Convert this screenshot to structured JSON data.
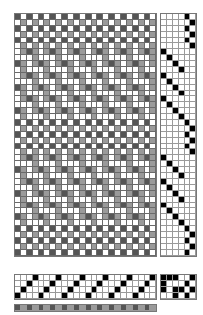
{
  "draft": {
    "warp_count": 24,
    "weft_count": 41,
    "shafts": 4,
    "treadles": 6,
    "cell_px": 5.9,
    "colors": {
      "warp_dark": "#555555",
      "warp_light": "#9a9a9a",
      "weft": "#ffffff",
      "grid_line": "#9a9a9a",
      "mark": "#000000"
    },
    "threading": [
      3,
      2,
      1,
      0,
      3,
      2,
      1,
      0,
      3,
      2,
      1,
      0,
      3,
      2,
      1,
      0,
      3,
      2,
      1,
      0,
      3,
      2,
      1,
      0
    ],
    "tieup": [
      [
        1,
        1,
        1,
        0,
        0,
        1
      ],
      [
        1,
        0,
        0,
        0,
        1,
        0
      ],
      [
        1,
        0,
        1,
        1,
        0,
        1
      ],
      [
        0,
        0,
        1,
        0,
        1,
        0
      ]
    ],
    "treadling": [
      4,
      5,
      4,
      5,
      4,
      5,
      0,
      1,
      2,
      3,
      0,
      1,
      2,
      3,
      0,
      1,
      2,
      3,
      4,
      5,
      4,
      5,
      4,
      5,
      0,
      1,
      2,
      3,
      0,
      1,
      2,
      3,
      0,
      1,
      2,
      3,
      4,
      5,
      4,
      5,
      4
    ],
    "warp_colors": [
      "dark",
      "light",
      "dark",
      "light",
      "dark",
      "light",
      "dark",
      "light",
      "dark",
      "light",
      "dark",
      "light",
      "dark",
      "light",
      "dark",
      "light",
      "dark",
      "light",
      "dark",
      "light",
      "dark",
      "light",
      "dark",
      "light"
    ]
  }
}
